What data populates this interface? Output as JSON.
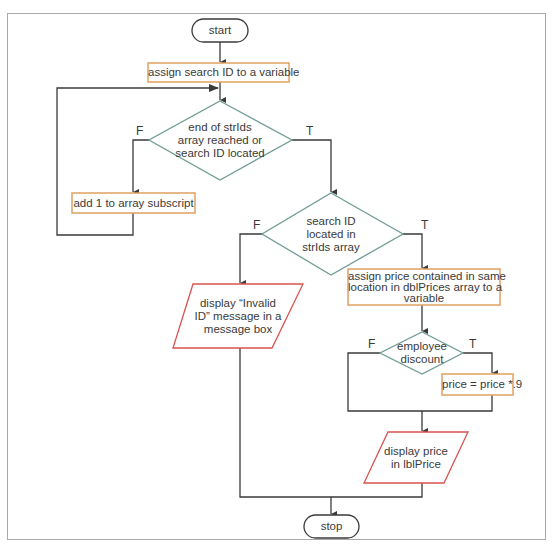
{
  "diagram": {
    "type": "flowchart",
    "colors": {
      "frame": "#a9a9a9",
      "line": "#3a3a3a",
      "process_border": "#e0a060",
      "io_border": "#d9534f",
      "decision_border": "#6f9c94",
      "terminal_border": "#3a3a3a",
      "text": "#3a3a3a"
    },
    "nodes": {
      "start": {
        "shape": "terminal",
        "label": "start"
      },
      "assign_search_id": {
        "shape": "process",
        "label": "assign search ID to a variable"
      },
      "loop_check": {
        "shape": "decision",
        "lines": [
          "end of strIds",
          "array reached or",
          "search ID located"
        ]
      },
      "add_subscript": {
        "shape": "process",
        "label": "add 1 to array subscript"
      },
      "id_located": {
        "shape": "decision",
        "lines": [
          "search ID",
          "located in",
          "strIds array"
        ]
      },
      "invalid_msg": {
        "shape": "io",
        "lines": [
          "display “Invalid",
          "ID” message in a",
          "message box"
        ]
      },
      "assign_price": {
        "shape": "process",
        "lines": [
          "assign price contained in same",
          "location in dblPrices array to a",
          "variable"
        ]
      },
      "employee_discount": {
        "shape": "decision",
        "lines": [
          "employee",
          "discount"
        ]
      },
      "apply_discount": {
        "shape": "process",
        "label": "price = price *.9"
      },
      "display_price": {
        "shape": "io",
        "lines": [
          "display price",
          "in lblPrice"
        ]
      },
      "stop": {
        "shape": "terminal",
        "label": "stop"
      }
    },
    "branch_labels": {
      "loop_check_false": "F",
      "loop_check_true": "T",
      "id_located_false": "F",
      "id_located_true": "T",
      "discount_false": "F",
      "discount_true": "T"
    },
    "edges": [
      {
        "from": "start",
        "to": "assign_search_id"
      },
      {
        "from": "assign_search_id",
        "to": "loop_check"
      },
      {
        "from": "loop_check",
        "to": "add_subscript",
        "label": "F"
      },
      {
        "from": "add_subscript",
        "to": "loop_check"
      },
      {
        "from": "loop_check",
        "to": "id_located",
        "label": "T"
      },
      {
        "from": "id_located",
        "to": "invalid_msg",
        "label": "F"
      },
      {
        "from": "id_located",
        "to": "assign_price",
        "label": "T"
      },
      {
        "from": "assign_price",
        "to": "employee_discount"
      },
      {
        "from": "employee_discount",
        "to": "apply_discount",
        "label": "T"
      },
      {
        "from": "employee_discount",
        "to": "display_price",
        "label": "F"
      },
      {
        "from": "apply_discount",
        "to": "display_price"
      },
      {
        "from": "display_price",
        "to": "stop"
      },
      {
        "from": "invalid_msg",
        "to": "stop"
      }
    ]
  }
}
